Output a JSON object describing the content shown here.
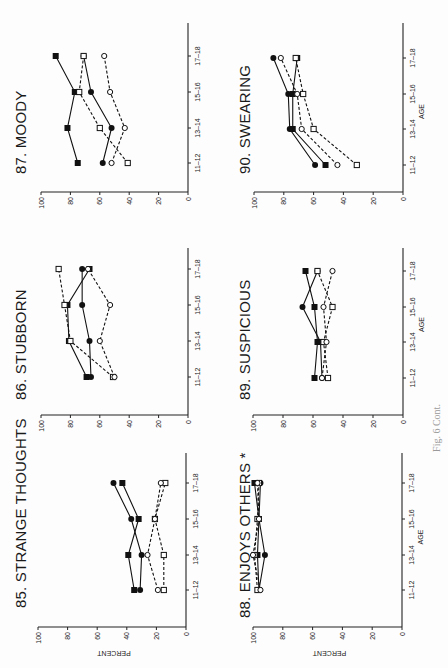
{
  "figure_caption": "Fig. 6 Cont.",
  "axis": {
    "y_label": "PERCENT",
    "x_label": "AGE",
    "y_ticks": [
      "0",
      "20",
      "40",
      "60",
      "80",
      "100"
    ],
    "x_ticks": [
      "11–12",
      "13–14",
      "15–16",
      "17–18"
    ]
  },
  "panels": [
    {
      "id": "85",
      "title": "85. STRANGE THOUGHTS"
    },
    {
      "id": "86",
      "title": "86. STUBBORN"
    },
    {
      "id": "87",
      "title": "87. MOODY"
    },
    {
      "id": "88",
      "title": "88. ENJOYS OTHERS *"
    },
    {
      "id": "89",
      "title": "89. SUSPICIOUS"
    },
    {
      "id": "90",
      "title": "90. SWEARING"
    }
  ],
  "chart_data": [
    {
      "type": "line",
      "title": "85. STRANGE THOUGHTS",
      "xlabel": "AGE",
      "ylabel": "PERCENT",
      "categories": [
        "11-12",
        "13-14",
        "15-16",
        "17-18"
      ],
      "ylim": [
        0,
        100
      ],
      "series": [
        {
          "name": "filled-square (solid)",
          "values": [
            35,
            39,
            32,
            43
          ]
        },
        {
          "name": "filled-circle (solid)",
          "values": [
            31,
            30,
            37,
            49
          ]
        },
        {
          "name": "open-square (dashed)",
          "values": [
            15,
            15,
            21,
            14
          ]
        },
        {
          "name": "open-circle (dashed)",
          "values": [
            19,
            26,
            21,
            17
          ]
        }
      ]
    },
    {
      "type": "line",
      "title": "86. STUBBORN",
      "xlabel": "AGE",
      "ylabel": "PERCENT",
      "categories": [
        "11-12",
        "13-14",
        "15-16",
        "17-18"
      ],
      "ylim": [
        0,
        100
      ],
      "series": [
        {
          "name": "filled-square (solid)",
          "values": [
            69,
            81,
            82,
            67
          ]
        },
        {
          "name": "filled-circle (solid)",
          "values": [
            66,
            67,
            72,
            72
          ]
        },
        {
          "name": "open-square (dashed)",
          "values": [
            51,
            80,
            84,
            88
          ]
        },
        {
          "name": "open-circle (dashed)",
          "values": [
            50,
            60,
            53,
            68
          ]
        }
      ]
    },
    {
      "type": "line",
      "title": "87. MOODY",
      "xlabel": "AGE",
      "ylabel": "PERCENT",
      "categories": [
        "11-12",
        "13-14",
        "15-16",
        "17-18"
      ],
      "ylim": [
        0,
        100
      ],
      "series": [
        {
          "name": "filled-square (solid)",
          "values": [
            75,
            82,
            77,
            90
          ]
        },
        {
          "name": "filled-circle (solid)",
          "values": [
            58,
            52,
            66,
            71
          ]
        },
        {
          "name": "open-square (dashed)",
          "values": [
            41,
            60,
            74,
            71
          ]
        },
        {
          "name": "open-circle (dashed)",
          "values": [
            52,
            43,
            53,
            57
          ]
        }
      ]
    },
    {
      "type": "line",
      "title": "88. ENJOYS OTHERS *",
      "xlabel": "AGE",
      "ylabel": "PERCENT",
      "categories": [
        "11-12",
        "13-14",
        "15-16",
        "17-18"
      ],
      "ylim": [
        0,
        100
      ],
      "series": [
        {
          "name": "filled-square (solid)",
          "values": [
            96,
            97,
            96,
            99
          ]
        },
        {
          "name": "filled-circle (solid)",
          "values": [
            96,
            92,
            96,
            95
          ]
        },
        {
          "name": "open-square (dashed)",
          "values": [
            97,
            99,
            97,
            96
          ]
        },
        {
          "name": "open-circle (dashed)",
          "values": [
            95,
            100,
            96,
            97
          ]
        }
      ]
    },
    {
      "type": "line",
      "title": "89. SUSPICIOUS",
      "xlabel": "AGE",
      "ylabel": "PERCENT",
      "categories": [
        "11-12",
        "13-14",
        "15-16",
        "17-18"
      ],
      "ylim": [
        0,
        100
      ],
      "series": [
        {
          "name": "filled-square (solid)",
          "values": [
            59,
            57,
            59,
            65
          ]
        },
        {
          "name": "filled-circle (solid)",
          "values": [
            54,
            55,
            67,
            57
          ]
        },
        {
          "name": "open-square (dashed)",
          "values": [
            50,
            53,
            47,
            57
          ]
        },
        {
          "name": "open-circle (dashed)",
          "values": [
            54,
            51,
            53,
            47
          ]
        }
      ]
    },
    {
      "type": "line",
      "title": "90. SWEARING",
      "xlabel": "AGE",
      "ylabel": "PERCENT",
      "categories": [
        "11-12",
        "13-14",
        "15-16",
        "17-18"
      ],
      "ylim": [
        0,
        100
      ],
      "series": [
        {
          "name": "filled-square (solid)",
          "values": [
            52,
            74,
            74,
            71
          ]
        },
        {
          "name": "filled-circle (solid)",
          "values": [
            59,
            76,
            77,
            87
          ]
        },
        {
          "name": "open-square (dashed)",
          "values": [
            31,
            60,
            67,
            72
          ]
        },
        {
          "name": "open-circle (dashed)",
          "values": [
            44,
            68,
            71,
            82
          ]
        }
      ]
    }
  ]
}
